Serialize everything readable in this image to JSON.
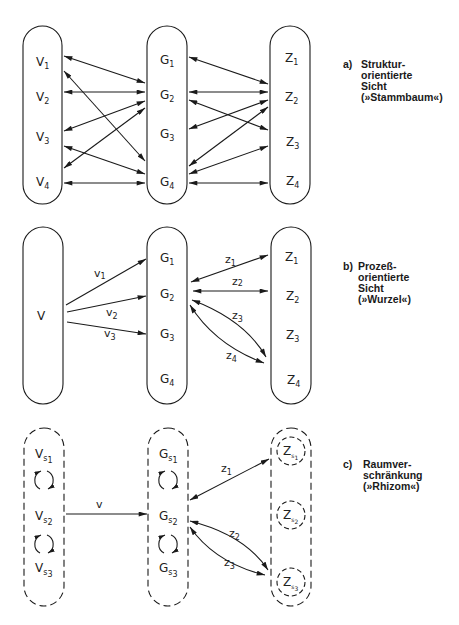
{
  "panels": [
    {
      "id": "a",
      "caption": {
        "letter": "a)",
        "lines": [
          "Struktur-",
          "orientierte",
          "Sicht",
          "(»Stammbaum«)"
        ]
      },
      "columns": {
        "V": [
          {
            "base": "V",
            "sub": "1"
          },
          {
            "base": "V",
            "sub": "2"
          },
          {
            "base": "V",
            "sub": "3"
          },
          {
            "base": "V",
            "sub": "4"
          }
        ],
        "G": [
          {
            "base": "G",
            "sub": "1"
          },
          {
            "base": "G",
            "sub": "2"
          },
          {
            "base": "G",
            "sub": "3"
          },
          {
            "base": "G",
            "sub": "4"
          }
        ],
        "Z": [
          {
            "base": "Z",
            "sub": "1"
          },
          {
            "base": "Z",
            "sub": "2"
          },
          {
            "base": "Z",
            "sub": "3"
          },
          {
            "base": "Z",
            "sub": "4"
          }
        ]
      },
      "edges": [
        [
          "V1",
          "G2"
        ],
        [
          "V1",
          "G4"
        ],
        [
          "V2",
          "G2"
        ],
        [
          "V3",
          "G2"
        ],
        [
          "V4",
          "G2"
        ],
        [
          "V3",
          "G4"
        ],
        [
          "V4",
          "G4"
        ],
        [
          "G1",
          "Z2"
        ],
        [
          "G2",
          "Z2"
        ],
        [
          "G2",
          "Z3"
        ],
        [
          "G3",
          "Z2"
        ],
        [
          "G4",
          "Z2"
        ],
        [
          "G4",
          "Z3"
        ],
        [
          "G4",
          "Z4"
        ]
      ],
      "border": "solid"
    },
    {
      "id": "b",
      "caption": {
        "letter": "b)",
        "lines": [
          "Prozeß-",
          "orientierte",
          "Sicht",
          "(»Wurzel«)"
        ]
      },
      "columns": {
        "V": [
          {
            "base": "V",
            "sub": ""
          }
        ],
        "G": [
          {
            "base": "G",
            "sub": "1"
          },
          {
            "base": "G",
            "sub": "2"
          },
          {
            "base": "G",
            "sub": "3"
          },
          {
            "base": "G",
            "sub": "4"
          }
        ],
        "Z": [
          {
            "base": "Z",
            "sub": "1"
          },
          {
            "base": "Z",
            "sub": "2"
          },
          {
            "base": "Z",
            "sub": "3"
          },
          {
            "base": "Z",
            "sub": "4"
          }
        ]
      },
      "edge_labels": {
        "v1": {
          "base": "v",
          "sub": "1"
        },
        "v2": {
          "base": "v",
          "sub": "2"
        },
        "v3": {
          "base": "v",
          "sub": "3"
        },
        "z1": {
          "base": "z",
          "sub": "1"
        },
        "z2": {
          "base": "z",
          "sub": "2"
        },
        "z3": {
          "base": "z",
          "sub": "3"
        },
        "z4": {
          "base": "z",
          "sub": "4"
        }
      },
      "edges": [
        [
          "V",
          "G1",
          "v1"
        ],
        [
          "V",
          "G2",
          "v2"
        ],
        [
          "V",
          "G3",
          "v3"
        ],
        [
          "G2",
          "Z1",
          "z1"
        ],
        [
          "G2",
          "Z2",
          "z2"
        ],
        [
          "G2",
          "Z4",
          "z3"
        ],
        [
          "G2",
          "Z4",
          "z4"
        ]
      ],
      "border": "solid"
    },
    {
      "id": "c",
      "caption": {
        "letter": "c)",
        "lines": [
          "Raumver-",
          "schränkung",
          "(»Rhizom«)"
        ]
      },
      "columns": {
        "V": [
          {
            "base": "V",
            "sub": "s",
            "subsub": "1"
          },
          {
            "base": "V",
            "sub": "s",
            "subsub": "2"
          },
          {
            "base": "V",
            "sub": "s",
            "subsub": "3"
          }
        ],
        "G": [
          {
            "base": "G",
            "sub": "s",
            "subsub": "1"
          },
          {
            "base": "G",
            "sub": "s",
            "subsub": "2"
          },
          {
            "base": "G",
            "sub": "s",
            "subsub": "3"
          }
        ],
        "Z": [
          {
            "base": "Z",
            "sub": "s",
            "subsub": "1"
          },
          {
            "base": "Z",
            "sub": "s",
            "subsub": "2"
          },
          {
            "base": "Z",
            "sub": "s",
            "subsub": "3"
          }
        ]
      },
      "edge_labels": {
        "v": {
          "base": "v",
          "sub": ""
        },
        "z1": {
          "base": "z",
          "sub": "1"
        },
        "z2": {
          "base": "z",
          "sub": "2"
        },
        "z3": {
          "base": "z",
          "sub": "3"
        }
      },
      "edges": [
        [
          "V",
          "G",
          "v"
        ],
        [
          "G",
          "Zs1",
          "z1"
        ],
        [
          "Gs2",
          "Zs3",
          "z2"
        ],
        [
          "Gs2",
          "Zs3",
          "z3"
        ]
      ],
      "border": "dashed",
      "cycle_icons": 4
    }
  ]
}
